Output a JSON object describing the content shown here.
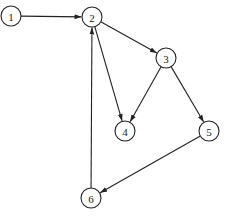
{
  "diagram": {
    "type": "directed-graph",
    "node_radius": 10,
    "nodes": [
      {
        "id": "1",
        "label": "1",
        "x": 11,
        "y": 16
      },
      {
        "id": "2",
        "label": "2",
        "x": 92,
        "y": 17
      },
      {
        "id": "3",
        "label": "3",
        "x": 166,
        "y": 58
      },
      {
        "id": "4",
        "label": "4",
        "x": 125,
        "y": 131
      },
      {
        "id": "5",
        "label": "5",
        "x": 209,
        "y": 131
      },
      {
        "id": "6",
        "label": "6",
        "x": 91,
        "y": 198
      }
    ],
    "edges": [
      {
        "from": "1",
        "to": "2"
      },
      {
        "from": "2",
        "to": "3"
      },
      {
        "from": "2",
        "to": "4"
      },
      {
        "from": "3",
        "to": "4"
      },
      {
        "from": "3",
        "to": "5"
      },
      {
        "from": "5",
        "to": "6"
      },
      {
        "from": "6",
        "to": "2"
      }
    ],
    "colors": {
      "stroke": "#222222",
      "fill": "#ffffff",
      "background": "#ffffff"
    }
  }
}
